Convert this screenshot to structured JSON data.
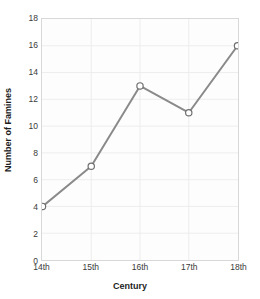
{
  "chart_data": {
    "type": "line",
    "title": "",
    "categories": [
      "14th",
      "15th",
      "16th",
      "17th",
      "18th"
    ],
    "values": [
      4,
      7,
      13,
      11,
      16
    ],
    "series": [
      {
        "name": "Number of Famines",
        "values": [
          4,
          7,
          13,
          11,
          16
        ]
      }
    ],
    "xlabel": "Century",
    "ylabel": "Number of Famines",
    "ylim": [
      0,
      18
    ],
    "y_ticks": [
      0,
      2,
      4,
      6,
      8,
      10,
      12,
      14,
      16,
      18
    ],
    "x_ticks": [
      "14th",
      "15th",
      "16th",
      "17th",
      "18th"
    ],
    "grid": true,
    "legend": "none",
    "marker": "open-circle",
    "colors": {
      "line": "#8a8a8a",
      "marker_fill": "#ffffff",
      "marker_stroke": "#6e6e6e",
      "grid": "#ededed",
      "plot_background": "#fdfdfd",
      "plot_border": "#d8d8d8",
      "text": "#1c1c1c",
      "tick_text": "#3a3a3a"
    }
  }
}
